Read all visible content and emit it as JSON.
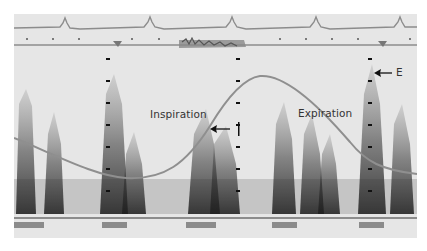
{
  "image": {
    "type": "pulsed-wave doppler spectral tracing with ECG and respirometer traces",
    "colors": {
      "background": "#e6e6e6",
      "ecg_trace": "#8c8c8c",
      "respiration_curve": "#8f8f8f",
      "spectral_signal": "#2a2a2a",
      "annotation_text": "#333333"
    }
  },
  "annotations": {
    "inspiration": "Inspiration",
    "expiration": "Expiration",
    "marker_i": "I",
    "marker_e": "E"
  },
  "traces": {
    "ecg_peaks_x": [
      66,
      150,
      232,
      316,
      400
    ],
    "respiration_markers_x": [
      105,
      370
    ],
    "scale_columns_x": [
      106,
      236,
      368
    ]
  }
}
